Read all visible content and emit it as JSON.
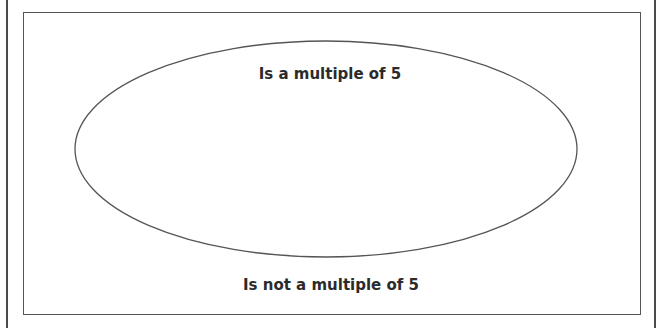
{
  "diagram": {
    "type": "venn-single-set",
    "set": {
      "label": "Is a multiple of 5",
      "shape": "ellipse"
    },
    "complement": {
      "label": "Is not a multiple of 5"
    },
    "colors": {
      "stroke": "#555555",
      "text": "#2b2b2b",
      "background": "#ffffff"
    }
  }
}
